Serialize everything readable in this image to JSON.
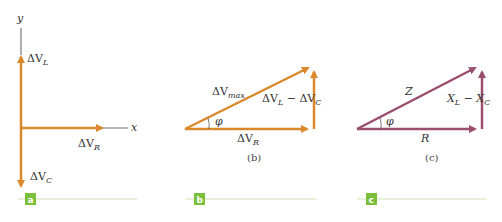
{
  "colors": {
    "voltage_arrow": "#d9892b",
    "impedance_arrow": "#9a4f6e",
    "axis": "#777777",
    "badge": "#7cbf3a",
    "rule": "#cfe3b5",
    "text": "#333333"
  },
  "panel_a": {
    "axis_y": "y",
    "axis_x": "x",
    "label_VL": "ΔV",
    "label_VL_sub": "L",
    "label_VR": "ΔV",
    "label_VR_sub": "R",
    "label_VC": "ΔV",
    "label_VC_sub": "C",
    "badge": "a"
  },
  "panel_b": {
    "hyp": "ΔV",
    "hyp_sub": "max",
    "vert_a": "ΔV",
    "vert_a_sub": "L",
    "vert_minus": " − ΔV",
    "vert_b_sub": "C",
    "base": "ΔV",
    "base_sub": "R",
    "angle": "φ",
    "caption": "(b)",
    "badge": "b"
  },
  "panel_c": {
    "hyp": "Z",
    "vert_a": "X",
    "vert_a_sub": "L",
    "vert_minus": " − X",
    "vert_b_sub": "C",
    "base": "R",
    "angle": "φ",
    "caption": "(c)",
    "badge": "c"
  }
}
